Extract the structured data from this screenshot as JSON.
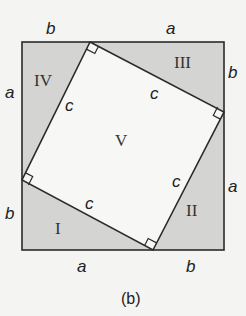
{
  "diagram": {
    "caption": "(b)",
    "colors": {
      "background": "#f4f4f2",
      "triangle_fill": "#d4d4d2",
      "inner_square_fill": "#f7f7f5",
      "stroke": "#2a2a2a"
    },
    "outer_side_labels": {
      "top_left": "b",
      "top_right": "a",
      "right_top": "b",
      "right_bottom": "a",
      "bottom_left": "a",
      "bottom_right": "b",
      "left_top": "a",
      "left_bottom": "b"
    },
    "hypotenuse_labels": {
      "top_left_c": "c",
      "top_right_c": "c",
      "bottom_right_c": "c",
      "bottom_left_c": "c"
    },
    "region_labels": {
      "triangle_1": "I",
      "triangle_2": "II",
      "triangle_3": "III",
      "triangle_4": "IV",
      "square_5": "V"
    }
  }
}
